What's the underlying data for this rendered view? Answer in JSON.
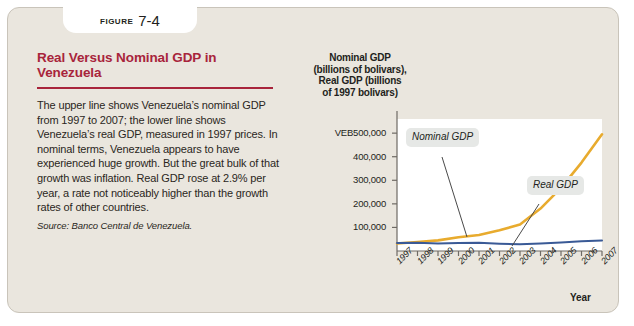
{
  "figure": {
    "tab_word": "FIGURE",
    "tab_number": "7-4",
    "title": "Real Versus Nominal GDP in Venezuela",
    "body": "The upper line shows Venezuela’s nominal GDP from 1997 to 2007; the lower line shows Venezuela’s real GDP, measured in 1997 prices. In nominal terms, Venezuela appears to have experienced huge growth. But the great bulk of that growth was inflation. Real GDP rose at 2.9% per year, a rate not noticeably higher than the growth rates of other countries.",
    "source": "Source: Banco Central de Venezuela.",
    "title_color": "#a8243b",
    "card_color": "#eae6de"
  },
  "chart_data": {
    "type": "line",
    "title": "Real Versus Nominal GDP in Venezuela",
    "ylabel_lines": [
      "Nominal GDP",
      "(billions of bolivars),",
      "Real GDP (billions",
      "of 1997 bolivars)"
    ],
    "xlabel": "Year",
    "x": [
      "1997",
      "1998",
      "1999",
      "2000",
      "2001",
      "2002",
      "2003",
      "2004",
      "2005",
      "2006",
      "2007"
    ],
    "ytick_labels": [
      "VEB500,000",
      "400,000",
      "300,000",
      "200,000",
      "100,000"
    ],
    "ytick_values": [
      500000,
      400000,
      300000,
      200000,
      100000
    ],
    "ylim": [
      0,
      560000
    ],
    "grid": false,
    "legend": "annotations",
    "series": [
      {
        "name": "Nominal GDP",
        "color": "#e8ab2e",
        "values": [
          32000,
          38000,
          45000,
          58000,
          68000,
          88000,
          112000,
          180000,
          268000,
          375000,
          495000
        ]
      },
      {
        "name": "Real GDP",
        "color": "#3a5a96",
        "values": [
          34000,
          34500,
          32000,
          33500,
          34500,
          31000,
          28500,
          32000,
          36000,
          41000,
          45000
        ]
      }
    ],
    "annotations": [
      {
        "name": "Nominal GDP",
        "target_x": "2003"
      },
      {
        "name": "Real GDP",
        "target_x": "2005"
      }
    ]
  }
}
